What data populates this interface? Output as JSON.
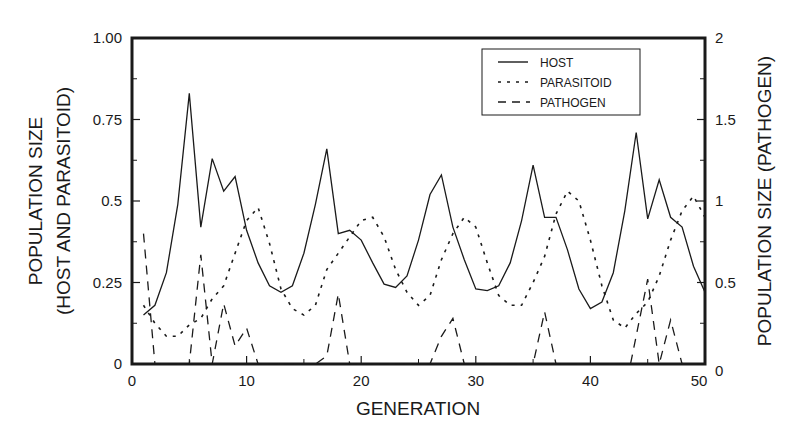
{
  "chart_data": {
    "type": "line",
    "title": "",
    "xlabel": "GENERATION",
    "ylabel": "POPULATION SIZE (HOST AND PARASITOID)",
    "ylabel_lines": [
      "POPULATION SIZE",
      "(HOST AND PARASITOID)"
    ],
    "y2label": "POPULATION SIZE (PATHOGEN)",
    "xlim": [
      0,
      50
    ],
    "ylim": [
      0,
      1.0
    ],
    "y2lim": [
      0,
      2
    ],
    "x_ticks": [
      0,
      10,
      20,
      30,
      40,
      50
    ],
    "x_tick_labels": [
      "0",
      "10",
      "20",
      "30",
      "40",
      "50"
    ],
    "y_ticks": [
      0,
      0.25,
      0.5,
      0.75,
      1.0
    ],
    "y_tick_labels": [
      "0",
      "0.25",
      "0.5",
      "0.75",
      "1.00"
    ],
    "y2_ticks": [
      0,
      0.5,
      1,
      1.5,
      2
    ],
    "y2_tick_labels": [
      "0",
      "0.5",
      "1",
      "1.5",
      "2"
    ],
    "grid": false,
    "legend_position": "upper right",
    "legend": [
      "HOST",
      "PARASITOID",
      "PATHOGEN"
    ],
    "series": [
      {
        "name": "HOST",
        "axis": "left",
        "style": "solid",
        "x": [
          1,
          2,
          3,
          4,
          5,
          6,
          7,
          8,
          9,
          10,
          11,
          12,
          13,
          14,
          15,
          16,
          17,
          18,
          19,
          20,
          21,
          22,
          23,
          24,
          25,
          26,
          27,
          28,
          29,
          30,
          31,
          32,
          33,
          34,
          35,
          36,
          37,
          38,
          39,
          40,
          41,
          42,
          43,
          44,
          45,
          46,
          47,
          48,
          49,
          50
        ],
        "values": [
          0.15,
          0.18,
          0.28,
          0.49,
          0.83,
          0.42,
          0.63,
          0.53,
          0.575,
          0.41,
          0.31,
          0.24,
          0.22,
          0.24,
          0.34,
          0.49,
          0.66,
          0.4,
          0.41,
          0.38,
          0.31,
          0.245,
          0.235,
          0.27,
          0.38,
          0.52,
          0.58,
          0.42,
          0.32,
          0.23,
          0.225,
          0.24,
          0.31,
          0.44,
          0.61,
          0.45,
          0.45,
          0.35,
          0.23,
          0.17,
          0.19,
          0.28,
          0.47,
          0.71,
          0.445,
          0.565,
          0.45,
          0.42,
          0.3,
          0.22
        ]
      },
      {
        "name": "PARASITOID",
        "axis": "left",
        "style": "dotted",
        "x": [
          1,
          2,
          3,
          4,
          5,
          6,
          7,
          8,
          9,
          10,
          11,
          12,
          13,
          14,
          15,
          16,
          17,
          18,
          19,
          20,
          21,
          22,
          23,
          24,
          25,
          26,
          27,
          28,
          29,
          30,
          31,
          32,
          33,
          34,
          35,
          36,
          37,
          38,
          39,
          40,
          41,
          42,
          43,
          44,
          45,
          46,
          47,
          48,
          49,
          50
        ],
        "values": [
          0.18,
          0.125,
          0.085,
          0.085,
          0.12,
          0.14,
          0.2,
          0.24,
          0.34,
          0.44,
          0.48,
          0.37,
          0.23,
          0.17,
          0.15,
          0.18,
          0.29,
          0.34,
          0.39,
          0.44,
          0.45,
          0.39,
          0.29,
          0.22,
          0.18,
          0.21,
          0.32,
          0.4,
          0.45,
          0.42,
          0.31,
          0.21,
          0.18,
          0.18,
          0.25,
          0.33,
          0.46,
          0.53,
          0.5,
          0.38,
          0.24,
          0.135,
          0.11,
          0.155,
          0.19,
          0.27,
          0.38,
          0.47,
          0.515,
          0.45
        ]
      },
      {
        "name": "PATHOGEN",
        "axis": "right",
        "style": "dashed",
        "x": [
          1,
          2,
          5,
          6,
          7,
          8,
          9,
          10,
          11,
          16,
          17,
          18,
          19,
          26,
          27,
          28,
          29,
          35,
          36,
          37,
          43.5,
          45,
          46,
          47,
          48
        ],
        "values": [
          0.8,
          0,
          0,
          0.67,
          0,
          0.37,
          0.11,
          0.22,
          0,
          0,
          0.05,
          0.43,
          0,
          0,
          0.17,
          0.28,
          0,
          0,
          0.32,
          0,
          0,
          0.52,
          0,
          0.27,
          0
        ]
      }
    ]
  }
}
